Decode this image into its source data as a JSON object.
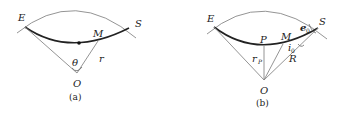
{
  "panels": [
    {
      "caption": "(a)",
      "labels": {
        "E": "E",
        "S": "S",
        "M": "M",
        "O": "O",
        "theta": "θ",
        "r": "r"
      }
    },
    {
      "caption": "(b)",
      "labels": {
        "E": "E",
        "S": "S",
        "M": "M",
        "O": "O",
        "P": "P",
        "R": "R",
        "rP": "r",
        "rP_sub": "P",
        "e0": "e",
        "e0_sub": "0",
        "i0": "i",
        "i0_sub": "0"
      }
    }
  ],
  "colors": {
    "thin_line": "#888888",
    "thick_curve": "#222222",
    "text": "#222222"
  }
}
